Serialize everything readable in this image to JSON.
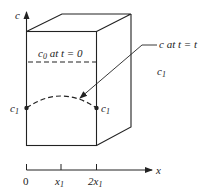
{
  "diagram": {
    "type": "diffusion-slab-schematic",
    "axes": {
      "vertical_label": "c",
      "horizontal_label": "x",
      "ticks": [
        {
          "label": "0"
        },
        {
          "label": "x",
          "sub": "1"
        },
        {
          "label": "2x",
          "sub": "1"
        }
      ]
    },
    "labels": {
      "initial": {
        "var": "c",
        "sub": "0",
        "text": " at ",
        "tvar": "t",
        "eq": " = 0"
      },
      "current": {
        "var": "c",
        "text": " at ",
        "tvar": "t",
        "eq": " = ",
        "tval": "t"
      },
      "outside": {
        "var": "c",
        "sub": "1"
      },
      "left_boundary": {
        "var": "c",
        "sub": "1"
      },
      "right_boundary": {
        "var": "c",
        "sub": "1"
      }
    },
    "colors": {
      "line": "#222222",
      "background": "#ffffff"
    }
  }
}
